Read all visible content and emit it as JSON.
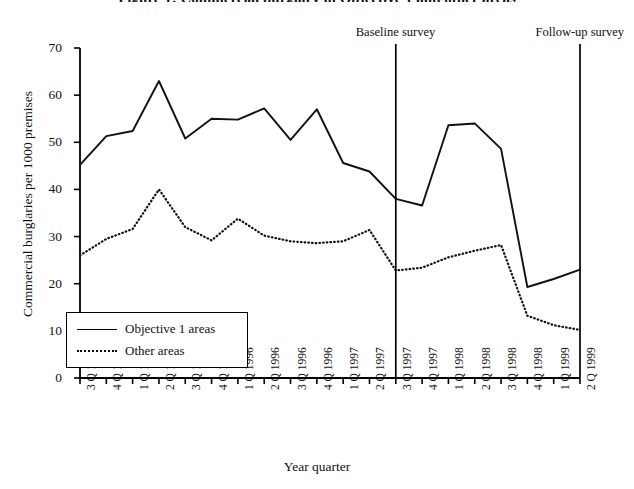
{
  "chart_data": {
    "type": "line",
    "title": "Figure 1: Commercial burglary in Objective 1 and other areas",
    "xlabel": "Year quarter",
    "ylabel": "Commercial burglaries per 1000 premises",
    "ylim": [
      0,
      70
    ],
    "yticks": [
      0,
      10,
      20,
      30,
      40,
      50,
      60,
      70
    ],
    "grid": false,
    "legend_position": "lower-left",
    "categories": [
      "3 Q 1994",
      "4 Q 1994",
      "1 Q 1995",
      "2 Q 1995",
      "3 Q 1995",
      "4 Q 1995",
      "1 Q 1996",
      "2 Q 1996",
      "3 Q 1996",
      "4 Q 1996",
      "1 Q 1997",
      "2 Q 1997",
      "3 Q 1997",
      "4 Q 1997",
      "1 Q 1998",
      "2 Q 1998",
      "3 Q 1998",
      "4 Q 1998",
      "1 Q 1999",
      "2 Q 1999"
    ],
    "series": [
      {
        "name": "Objective 1 areas",
        "style": "solid",
        "values": [
          45.2,
          51.3,
          52.4,
          63.0,
          50.8,
          55.0,
          54.8,
          57.2,
          50.5,
          57.0,
          45.6,
          43.8,
          38.0,
          36.6,
          53.6,
          54.0,
          48.6,
          19.3,
          21.0,
          23.0
        ]
      },
      {
        "name": "Other areas",
        "style": "dotted",
        "values": [
          26.0,
          29.5,
          31.6,
          40.0,
          32.0,
          29.2,
          33.8,
          30.2,
          29.0,
          28.6,
          29.0,
          31.4,
          22.8,
          23.4,
          25.6,
          27.0,
          28.2,
          13.2,
          11.2,
          10.2
        ]
      }
    ],
    "annotations": [
      {
        "label": "Baseline survey",
        "at_category": "3 Q 1997",
        "index": 12
      },
      {
        "label": "Follow-up survey",
        "at_category": "2 Q 1999",
        "index": 19
      }
    ]
  }
}
